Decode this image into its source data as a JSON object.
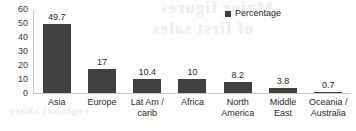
{
  "chart_data": {
    "type": "bar",
    "title": "",
    "xlabel": "",
    "ylabel": "",
    "categories": [
      "Asia",
      "Europe",
      "Lat Am /\ncarib",
      "Africa",
      "North\nAmerica",
      "Middle\nEast",
      "Oceania /\nAustralia"
    ],
    "values": [
      49.7,
      17,
      10.4,
      10,
      8.2,
      3.8,
      0.7
    ],
    "value_labels": [
      "49.7",
      "17",
      "10.4",
      "10",
      "8.2",
      "3.8",
      "0.7"
    ],
    "ylim": [
      0,
      60
    ],
    "yticks": [
      60,
      50,
      40,
      30,
      20,
      10,
      0
    ],
    "ytick_labels": [
      "60",
      "50",
      "40",
      "30",
      "20",
      "10",
      "0"
    ],
    "grid": false,
    "legend_position": "top-right",
    "series": [
      {
        "name": "Percentage",
        "color": "#404040",
        "values": [
          49.7,
          17,
          10.4,
          10,
          8.2,
          3.8,
          0.7
        ]
      }
    ]
  },
  "legend": {
    "label": "Percentage",
    "swatch_color": "#404040"
  },
  "artifact": {
    "bleed_line_1": "Major figures",
    "bleed_line_2": "of first sales",
    "bleed_line_3": "regional share"
  }
}
